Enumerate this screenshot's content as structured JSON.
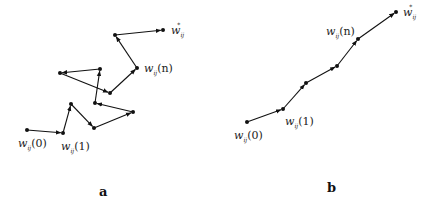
{
  "diagram": {
    "colors": {
      "line": "#111111",
      "point": "#111111",
      "text": "#222222"
    },
    "panels": [
      {
        "id": "a",
        "caption": "a",
        "points": [
          [
            27,
            130
          ],
          [
            63,
            133
          ],
          [
            71,
            104
          ],
          [
            94,
            128
          ],
          [
            133,
            112
          ],
          [
            95,
            103
          ],
          [
            100,
            69
          ],
          [
            60,
            73
          ],
          [
            110,
            93
          ],
          [
            137,
            68
          ],
          [
            115,
            35
          ],
          [
            163,
            30
          ]
        ],
        "labels": [
          {
            "base": "w",
            "sub": "ij",
            "arg": "(0)",
            "x": 18,
            "y": 147
          },
          {
            "base": "w",
            "sub": "ij",
            "arg": "(1)",
            "x": 61,
            "y": 150
          },
          {
            "base": "w",
            "sub": "ij",
            "arg": "(n)",
            "x": 144,
            "y": 72
          },
          {
            "base": "w",
            "sub": "ij",
            "sup": "*",
            "x": 171,
            "y": 34
          }
        ]
      },
      {
        "id": "b",
        "caption": "b",
        "points": [
          [
            247,
            122
          ],
          [
            283,
            109
          ],
          [
            306,
            83
          ],
          [
            337,
            66
          ],
          [
            358,
            39
          ],
          [
            396,
            12
          ]
        ],
        "labels": [
          {
            "base": "w",
            "sub": "ij",
            "arg": "(0)",
            "x": 234,
            "y": 139
          },
          {
            "base": "w",
            "sub": "ij",
            "arg": "(1)",
            "x": 285,
            "y": 125
          },
          {
            "base": "w",
            "sub": "ij",
            "arg": "(n)",
            "x": 326,
            "y": 35
          },
          {
            "base": "w",
            "sub": "ij",
            "sup": "*",
            "x": 403,
            "y": 16
          }
        ]
      }
    ],
    "captions": {
      "a": {
        "text": "a",
        "x": 99,
        "y": 196
      },
      "b": {
        "text": "b",
        "x": 327,
        "y": 192
      }
    }
  }
}
